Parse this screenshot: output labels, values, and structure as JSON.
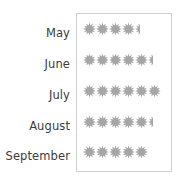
{
  "chart_data": {
    "type": "bar",
    "chart_style": "pictograph",
    "title": "",
    "subtitle": "",
    "xlabel": "",
    "ylabel": "",
    "categories": [
      "May",
      "June",
      "July",
      "August",
      "September"
    ],
    "values": [
      4.5,
      5.5,
      6,
      5.5,
      5
    ],
    "series": [
      {
        "name": "",
        "values": [
          4.5,
          5.5,
          6,
          5.5,
          5
        ]
      }
    ],
    "symbol": "sun-icon",
    "symbol_color": "#a6a6a6",
    "symbol_value": 1,
    "partial_symbols": [
      0.5,
      0.5,
      0,
      0.5,
      0
    ],
    "full_symbols": [
      4,
      5,
      6,
      5,
      5
    ],
    "xlim": [
      0,
      7
    ],
    "grid": false,
    "legend": false,
    "legend_position": "none",
    "annotations": []
  },
  "plot": {
    "border_color": "#cfcfcf",
    "background": "#ffffff",
    "rows": [
      {
        "label": "May",
        "full": 4,
        "half": 1
      },
      {
        "label": "June",
        "full": 5,
        "half": 1
      },
      {
        "label": "July",
        "full": 6,
        "half": 0
      },
      {
        "label": "August",
        "full": 5,
        "half": 1
      },
      {
        "label": "September",
        "full": 5,
        "half": 0
      }
    ]
  },
  "labels": {
    "month_0": "May",
    "month_1": "June",
    "month_2": "July",
    "month_3": "August",
    "month_4": "September"
  },
  "colors": {
    "symbol": "#a6a6a6",
    "text": "#3b3b3b",
    "border": "#cfcfcf",
    "background": "#ffffff"
  }
}
